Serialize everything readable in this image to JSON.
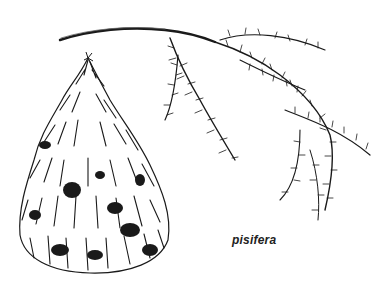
{
  "illustration": {
    "caption": "pisifera",
    "subjects": [
      "conifer-tree-habit",
      "foliage-spray-branch"
    ],
    "ink_color": "#1a1a1a",
    "background_color": "#ffffff"
  }
}
